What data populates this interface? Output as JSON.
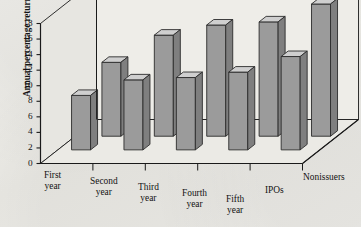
{
  "chart_data": {
    "type": "bar",
    "title": "",
    "subtitle": "",
    "xlabel": "",
    "ylabel": "Annual percentage returns",
    "zlabel": "",
    "categories": [
      "First year",
      "Second year",
      "Third year",
      "Fourth year",
      "Fifth year"
    ],
    "category_lines": [
      [
        "First",
        "year"
      ],
      [
        "Second",
        "year"
      ],
      [
        "Third",
        "year"
      ],
      [
        "Fourth",
        "year"
      ],
      [
        "Fifth",
        "year"
      ]
    ],
    "series": [
      {
        "name": "IPOs",
        "values": [
          7.0,
          9.0,
          9.3,
          10.0,
          12.0
        ]
      },
      {
        "name": "Nonissuers",
        "values": [
          9.5,
          13.0,
          14.3,
          14.7,
          17.0
        ]
      }
    ],
    "legend": [
      "IPOs",
      "Nonissuers"
    ],
    "legend_position": "depth-axis-right",
    "depth_axis_labels": [
      "IPOs",
      "Nonissuers"
    ],
    "yticks": [
      0,
      2,
      4,
      6,
      8,
      10,
      12,
      14,
      16,
      18
    ],
    "ylim": [
      0,
      18
    ],
    "grid": false,
    "three_d": true,
    "colors": {
      "bar_front": "#9b9b9b",
      "bar_top": "#cfcfcf",
      "bar_side": "#7f7f7f",
      "bar_outline": "#2b2b2b",
      "floor": "#e9e8e3",
      "back_wall": "#eeedE8",
      "axis": "#1a1a1a",
      "text": "#131313",
      "paper": "#efeeea"
    }
  }
}
